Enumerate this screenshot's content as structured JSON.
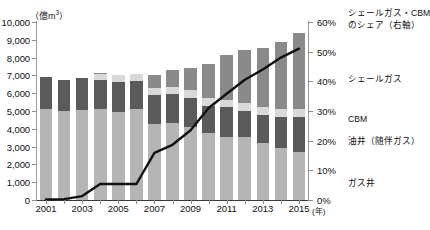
{
  "chart_data": {
    "type": "bar",
    "title": "",
    "subtitle": "",
    "xlabel": "(年)",
    "ylabel": "(億m³)",
    "y_unit_left": "(億m³)",
    "y_unit_right": "%",
    "ylim": [
      0,
      10000
    ],
    "ylim_right": [
      0,
      60
    ],
    "grid": false,
    "legend_position": "right",
    "stacked": true,
    "categories": [
      "2001",
      "2002",
      "2003",
      "2004",
      "2005",
      "2006",
      "2007",
      "2008",
      "2009",
      "2010",
      "2011",
      "2012",
      "2013",
      "2014",
      "2015"
    ],
    "x_tick_labels": [
      "2001",
      "",
      "2003",
      "",
      "2005",
      "",
      "2007",
      "",
      "2009",
      "",
      "2011",
      "",
      "2013",
      "",
      "2015"
    ],
    "y_ticks_left": [
      "10,000",
      "9,000",
      "8,000",
      "7,000",
      "6,000",
      "5,000",
      "4,000",
      "3,000",
      "2,000",
      "1,000",
      "0"
    ],
    "y_tick_values_left": [
      10000,
      9000,
      8000,
      7000,
      6000,
      5000,
      4000,
      3000,
      2000,
      1000,
      0
    ],
    "y_ticks_right": [
      "60%",
      "50%",
      "40%",
      "30%",
      "20%",
      "10%",
      "0%"
    ],
    "y_tick_values_right": [
      60,
      50,
      40,
      30,
      20,
      10,
      0
    ],
    "series": [
      {
        "name": "ガス井",
        "color": "#b5b5b5",
        "values": [
          5120,
          5020,
          5050,
          5120,
          4930,
          5110,
          4270,
          4310,
          4130,
          3740,
          3520,
          3540,
          3230,
          2920,
          2700
        ]
      },
      {
        "name": "油井（随伴ガス）",
        "color": "#5a5a5a",
        "values": [
          1800,
          1750,
          1830,
          1640,
          1700,
          1580,
          1620,
          1630,
          1610,
          1560,
          1700,
          1470,
          1570,
          1760,
          1970
        ]
      },
      {
        "name": "CBM",
        "color": "#d9d9d9",
        "values": [
          0,
          0,
          0,
          330,
          370,
          370,
          380,
          400,
          420,
          430,
          420,
          430,
          420,
          430,
          420
        ]
      },
      {
        "name": "シェールガス",
        "color": "#8a8a8a",
        "values": [
          0,
          0,
          0,
          60,
          0,
          0,
          730,
          960,
          1280,
          1930,
          2490,
          2970,
          3300,
          3790,
          4290
        ]
      }
    ],
    "line_series": {
      "name": "シェールガス・CBMのシェア（右軸）",
      "axis": "right",
      "color": "#111111",
      "unit": "%",
      "values": [
        0.2,
        0.3,
        1.3,
        5.4,
        5.4,
        5.4,
        15.9,
        18.6,
        23.5,
        31.0,
        35.8,
        40.5,
        44.0,
        48.0,
        51.0
      ]
    },
    "legend_entries": [
      {
        "label": "シェールガス・CBMのシェア（右軸）",
        "type": "line",
        "color": "#111111"
      },
      {
        "label": "シェールガス",
        "type": "fill",
        "color": "#8a8a8a"
      },
      {
        "label": "CBM",
        "type": "fill",
        "color": "#d9d9d9"
      },
      {
        "label": "油井（随伴ガス）",
        "type": "fill",
        "color": "#5a5a5a"
      },
      {
        "label": "ガス井",
        "type": "fill",
        "color": "#b5b5b5"
      }
    ]
  },
  "legend": {
    "line_label_1": "シェールガス・CBM",
    "line_label_2": "のシェア（右軸）",
    "shale": "シェールガス",
    "cbm": "CBM",
    "oil_well": "油井（随伴ガス）",
    "gas_well": "ガス井"
  },
  "axes": {
    "unit_left_prefix": "（億m",
    "unit_left_exp": "3",
    "unit_left_suffix": "）",
    "x_unit": "(年)"
  }
}
